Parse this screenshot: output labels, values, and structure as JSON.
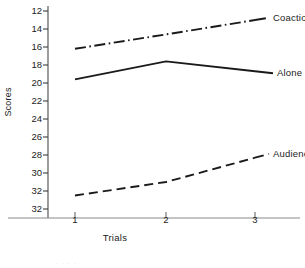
{
  "chart_data": {
    "type": "line",
    "title": "",
    "xlabel": "Trials",
    "ylabel": "Scores",
    "x": [
      1,
      2,
      3
    ],
    "xtick_labels": [
      "1",
      "2",
      "3"
    ],
    "ytick_labels": [
      "12",
      "14",
      "16",
      "18",
      "20",
      "22",
      "24",
      "26",
      "28",
      "30",
      "32",
      "32"
    ],
    "ytick_values": [
      12,
      14,
      16,
      18,
      20,
      22,
      24,
      26,
      28,
      30,
      32,
      34
    ],
    "ylim": [
      12,
      34
    ],
    "y_axis_inverted": true,
    "xlim": [
      0.6,
      3.6
    ],
    "grid": false,
    "legend_position": "inline-right-of-line-end",
    "line_color": "#1a1a1a",
    "background_color": "#ffffff",
    "series": [
      {
        "name": "Coaction",
        "label": "Coaction",
        "linestyle": "dash-dot",
        "values": [
          16.2,
          14.6,
          13.0
        ]
      },
      {
        "name": "Alone",
        "label": "Alone",
        "linestyle": "solid",
        "values": [
          19.6,
          17.6,
          18.7
        ]
      },
      {
        "name": "Audience",
        "label": "Audience",
        "linestyle": "dashed",
        "values": [
          32.5,
          31.0,
          28.3
        ]
      }
    ]
  },
  "artifact": {
    "bottom_smudge": ". . . ."
  }
}
